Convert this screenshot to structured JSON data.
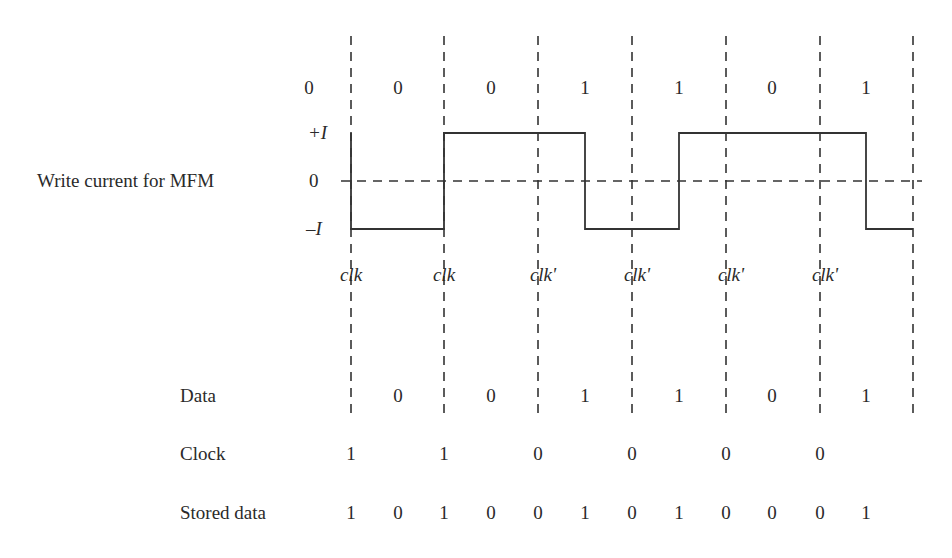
{
  "title": "Write current for MFM",
  "levels": {
    "plus": "+I",
    "zero": "0",
    "minus": "–I"
  },
  "boundaries_x": [
    351,
    444,
    538,
    632,
    726,
    820,
    913
  ],
  "top_bits": [
    {
      "x": 309,
      "text": "0"
    },
    {
      "x": 398,
      "text": "0"
    },
    {
      "x": 491,
      "text": "0"
    },
    {
      "x": 585,
      "text": "1"
    },
    {
      "x": 679,
      "text": "1"
    },
    {
      "x": 772,
      "text": "0"
    },
    {
      "x": 866,
      "text": "1"
    }
  ],
  "clk_labels": [
    {
      "x": 351,
      "text": "clk"
    },
    {
      "x": 444,
      "text": "clk"
    },
    {
      "x": 543,
      "text": "clk'"
    },
    {
      "x": 637,
      "text": "clk'"
    },
    {
      "x": 731,
      "text": "clk'"
    },
    {
      "x": 825,
      "text": "clk'"
    }
  ],
  "waveform": {
    "levels_y": {
      "plus": 133,
      "zero": 181,
      "minus": 229
    },
    "points": "351,133 351,229 444,229 444,133 585,133 585,229 679,229 679,133 866,133 866,229 913,229"
  },
  "rows": {
    "data": {
      "label": "Data",
      "values": [
        {
          "x": 398,
          "text": "0"
        },
        {
          "x": 491,
          "text": "0"
        },
        {
          "x": 585,
          "text": "1"
        },
        {
          "x": 679,
          "text": "1"
        },
        {
          "x": 772,
          "text": "0"
        },
        {
          "x": 866,
          "text": "1"
        }
      ]
    },
    "clock": {
      "label": "Clock",
      "values": [
        {
          "x": 351,
          "text": "1"
        },
        {
          "x": 444,
          "text": "1"
        },
        {
          "x": 538,
          "text": "0"
        },
        {
          "x": 632,
          "text": "0"
        },
        {
          "x": 726,
          "text": "0"
        },
        {
          "x": 820,
          "text": "0"
        }
      ]
    },
    "stored": {
      "label": "Stored data",
      "values": [
        {
          "x": 351,
          "text": "1"
        },
        {
          "x": 398,
          "text": "0"
        },
        {
          "x": 444,
          "text": "1"
        },
        {
          "x": 491,
          "text": "0"
        },
        {
          "x": 538,
          "text": "0"
        },
        {
          "x": 585,
          "text": "1"
        },
        {
          "x": 632,
          "text": "0"
        },
        {
          "x": 679,
          "text": "1"
        },
        {
          "x": 726,
          "text": "0"
        },
        {
          "x": 772,
          "text": "0"
        },
        {
          "x": 820,
          "text": "0"
        },
        {
          "x": 866,
          "text": "1"
        }
      ]
    }
  }
}
